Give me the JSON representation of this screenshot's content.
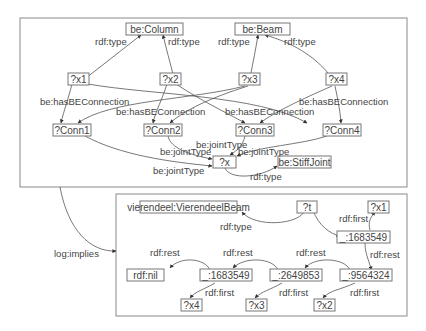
{
  "diagram": {
    "title": "",
    "premise_graph": {
      "nodes": {
        "column": "be:Column",
        "beam": "be:Beam",
        "x1": "?x1",
        "x2": "?x2",
        "x3": "?x3",
        "x4": "?x4",
        "conn1": "?Conn1",
        "conn2": "?Conn2",
        "conn3": "?Conn3",
        "conn4": "?Conn4",
        "x": "?x",
        "stiffjoint": "be:StiffJoint"
      },
      "edges": [
        {
          "from": "?x1",
          "to": "be:Column",
          "label": "rdf:type"
        },
        {
          "from": "?x2",
          "to": "be:Column",
          "label": "rdf:type"
        },
        {
          "from": "?x3",
          "to": "be:Beam",
          "label": "rdf:type"
        },
        {
          "from": "?x4",
          "to": "be:Beam",
          "label": "rdf:type"
        },
        {
          "from": "?x1",
          "to": "?Conn1",
          "label": "be:hasBEConnection"
        },
        {
          "from": "?x1",
          "to": "?Conn4",
          "label": "be:hasBEConnection"
        },
        {
          "from": "?x2",
          "to": "?Conn2",
          "label": "be:hasBEConnection"
        },
        {
          "from": "?x2",
          "to": "?Conn3",
          "label": "be:hasBEConnection"
        },
        {
          "from": "?x3",
          "to": "?Conn1",
          "label": "be:hasBEConnection"
        },
        {
          "from": "?x3",
          "to": "?Conn2",
          "label": "be:hasBEConnection"
        },
        {
          "from": "?x4",
          "to": "?Conn3",
          "label": "be:hasBEConnection"
        },
        {
          "from": "?x4",
          "to": "?Conn4",
          "label": "be:hasBEConnection"
        },
        {
          "from": "?Conn1",
          "to": "?x",
          "label": "be:jointType"
        },
        {
          "from": "?Conn2",
          "to": "?x",
          "label": "be:jointType"
        },
        {
          "from": "?Conn3",
          "to": "?x",
          "label": "be:jointType"
        },
        {
          "from": "?Conn4",
          "to": "?x",
          "label": "be:jointType"
        },
        {
          "from": "?x",
          "to": "be:StiffJoint",
          "label": "rdf:type"
        }
      ]
    },
    "implication": {
      "label": "log:implies"
    },
    "conclusion_graph": {
      "nodes": {
        "vbeam": "vierendeel:VierendeelBeam",
        "t": "?t",
        "cx1": "?x1",
        "b1": "_:1683549",
        "nil": "rdf:nil",
        "b2": "_:1683549",
        "b3": "_:2649853",
        "b4": "_:9564324",
        "cx4": "?x4",
        "cx3": "?x3",
        "cx2": "?x2"
      },
      "edges": [
        {
          "from": "?t",
          "to": "vierendeel:VierendeelBeam",
          "label": "rdf:type"
        },
        {
          "from": "?t",
          "to": "_:1683549",
          "label": ""
        },
        {
          "from": "_:1683549",
          "to": "?x1",
          "label": "rdf:first"
        },
        {
          "from": "_:1683549",
          "to": "_:9564324",
          "label": "rdf:rest"
        },
        {
          "from": "_:9564324",
          "to": "_:2649853",
          "label": "rdf:rest"
        },
        {
          "from": "_:9564324",
          "to": "?x2",
          "label": "rdf:first"
        },
        {
          "from": "_:2649853",
          "to": "_:1683549",
          "label": "rdf:rest"
        },
        {
          "from": "_:2649853",
          "to": "?x3",
          "label": "rdf:first"
        },
        {
          "from": "_:1683549",
          "to": "rdf:nil",
          "label": "rdf:rest"
        },
        {
          "from": "_:1683549",
          "to": "?x4",
          "label": "rdf:first"
        }
      ]
    },
    "labels": {
      "rdf_type": "rdf:type",
      "has_conn": "be:hasBEConnection",
      "joint_type": "be:jointType",
      "rdf_rest": "rdf:rest",
      "rdf_first": "rdf:first",
      "log_implies": "log:implies"
    }
  }
}
